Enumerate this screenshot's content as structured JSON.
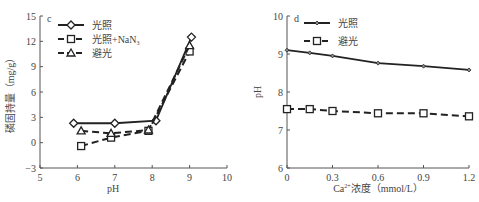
{
  "chart_data": [
    {
      "type": "line",
      "panel_label": "c",
      "title": "",
      "xlabel": "pH",
      "ylabel": "磷固持量（mg/g）",
      "xlim": [
        5,
        10
      ],
      "ylim": [
        -3,
        15
      ],
      "xticks": [
        5,
        6,
        7,
        8,
        9,
        10
      ],
      "yticks": [
        -3,
        0,
        3,
        6,
        9,
        12,
        15
      ],
      "grid": false,
      "legend_position": "upper-left",
      "series": [
        {
          "name": "光照",
          "style": "solid",
          "marker": "circle",
          "x": [
            5.9,
            7.0,
            8.1,
            9.05
          ],
          "y": [
            2.3,
            2.3,
            2.6,
            12.5
          ]
        },
        {
          "name": "光照+NaN₃",
          "style": "dashed",
          "marker": "square",
          "x": [
            6.1,
            6.9,
            7.9,
            9.0
          ],
          "y": [
            -0.4,
            0.6,
            1.4,
            10.8
          ]
        },
        {
          "name": "避光",
          "style": "dashed",
          "marker": "triangle",
          "x": [
            6.1,
            6.9,
            7.9,
            9.0
          ],
          "y": [
            1.4,
            1.1,
            1.5,
            11.5
          ]
        }
      ]
    },
    {
      "type": "line",
      "panel_label": "d",
      "title": "",
      "xlabel": "Ca²⁺浓度（mmol/L）",
      "ylabel": "pH",
      "xlim": [
        0,
        1.2
      ],
      "ylim": [
        6,
        10
      ],
      "xticks": [
        0,
        0.3,
        0.6,
        0.9,
        1.2
      ],
      "yticks": [
        6,
        7,
        8,
        9,
        10
      ],
      "grid": false,
      "legend_position": "upper-left",
      "series": [
        {
          "name": "光照",
          "style": "solid",
          "marker": "small-diamond",
          "x": [
            0,
            0.15,
            0.3,
            0.6,
            0.9,
            1.2
          ],
          "y": [
            9.1,
            9.03,
            8.95,
            8.76,
            8.68,
            8.58
          ]
        },
        {
          "name": "避光",
          "style": "dashed",
          "marker": "square",
          "x": [
            0,
            0.15,
            0.3,
            0.6,
            0.9,
            1.2
          ],
          "y": [
            7.55,
            7.55,
            7.5,
            7.44,
            7.44,
            7.36
          ]
        }
      ]
    }
  ],
  "labels": {
    "c": {
      "panel": "c",
      "xlabel": "pH",
      "ylabel": "磷固持量（mg/g）",
      "xticks": [
        "5",
        "6",
        "7",
        "8",
        "9",
        "10"
      ],
      "yticks": [
        "−3",
        "0",
        "3",
        "6",
        "9",
        "12",
        "15"
      ],
      "legend": [
        "光照",
        "光照+NaN",
        "避光"
      ],
      "legend_sub": "3"
    },
    "d": {
      "panel": "d",
      "xlabel_pre": "Ca",
      "xlabel_sup": "2+",
      "xlabel_post": "浓度（mmol/L）",
      "ylabel": "pH",
      "xticks": [
        "0",
        "0.3",
        "0.6",
        "0.9",
        "1.2"
      ],
      "yticks": [
        "6",
        "7",
        "8",
        "9",
        "10"
      ],
      "legend": [
        "光照",
        "避光"
      ]
    }
  },
  "colors": {
    "line": "#222222",
    "axis": "#555555",
    "text": "#444444",
    "marker_fill": "#ffffff"
  }
}
